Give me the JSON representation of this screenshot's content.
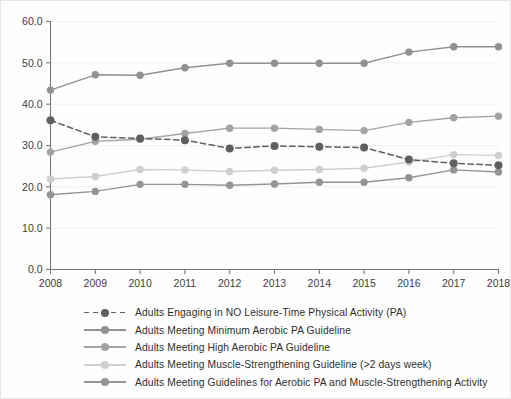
{
  "chart_data": {
    "type": "line",
    "title": "",
    "xlabel": "",
    "ylabel": "",
    "categories": [
      "2008",
      "2009",
      "2010",
      "2011",
      "2012",
      "2013",
      "2014",
      "2015",
      "2016",
      "2017",
      "2018"
    ],
    "x": [
      2008,
      2009,
      2010,
      2011,
      2012,
      2013,
      2014,
      2015,
      2016,
      2017,
      2018
    ],
    "xlim": [
      2008,
      2018
    ],
    "ylim": [
      0.0,
      60.0
    ],
    "yticks": [
      0.0,
      10.0,
      20.0,
      30.0,
      40.0,
      50.0,
      60.0
    ],
    "ytick_labels": [
      "0.0",
      "10.0",
      "20.0",
      "30.0",
      "40.0",
      "50.0",
      "60.0"
    ],
    "xtick_labels": [
      "2008",
      "2009",
      "2010",
      "2011",
      "2012",
      "2013",
      "2014",
      "2015",
      "2016",
      "2017",
      "2018"
    ],
    "grid": true,
    "grid_axis": "y",
    "legend_position": "below",
    "series": [
      {
        "name": "Adults Engaging in NO Leisure-Time Physical Activity (PA)",
        "color": "#5f5f5f",
        "linestyle": "dashed",
        "marker": "circle",
        "values": [
          36.1,
          32.1,
          31.7,
          31.3,
          29.3,
          29.9,
          29.7,
          29.5,
          26.6,
          25.7,
          25.2
        ]
      },
      {
        "name": "Adults Meeting Minimum Aerobic PA Guideline",
        "color": "#919191",
        "linestyle": "solid",
        "marker": "circle",
        "values": [
          43.4,
          47.1,
          47.0,
          48.8,
          49.9,
          49.9,
          49.9,
          49.9,
          52.6,
          53.9,
          53.9
        ]
      },
      {
        "name": "Adults Meeting High Aerobic PA Guideline",
        "color": "#a3a3a3",
        "linestyle": "solid",
        "marker": "circle",
        "values": [
          28.4,
          31.0,
          31.5,
          32.9,
          34.2,
          34.2,
          33.9,
          33.6,
          35.6,
          36.7,
          37.1
        ]
      },
      {
        "name": "Adults Meeting Muscle-Strengthening Guideline (>2 days week)",
        "color": "#cfcfcf",
        "linestyle": "solid",
        "marker": "circle",
        "values": [
          21.9,
          22.5,
          24.2,
          24.1,
          23.7,
          24.0,
          24.2,
          24.5,
          26.0,
          27.8,
          27.6
        ]
      },
      {
        "name": "Adults Meeting Guidelines for Aerobic PA and Muscle-Strengthening Activity",
        "color": "#949494",
        "linestyle": "solid",
        "marker": "circle",
        "values": [
          18.1,
          18.9,
          20.6,
          20.6,
          20.4,
          20.7,
          21.1,
          21.1,
          22.2,
          24.1,
          23.6
        ]
      }
    ]
  },
  "axes": {
    "grid_color": "#efefef",
    "spine_color": "#777777",
    "tick_color": "#777777",
    "background": "#fefefe"
  }
}
